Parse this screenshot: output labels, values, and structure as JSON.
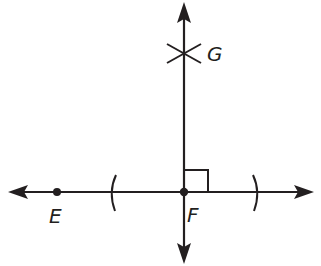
{
  "diagram": {
    "type": "geometric-construction",
    "colors": {
      "ink": "#231f20",
      "background": "#ffffff"
    },
    "points": {
      "E": {
        "label": "E",
        "x": 57,
        "y": 192
      },
      "F": {
        "label": "F",
        "x": 184,
        "y": 192
      },
      "G": {
        "label": "G",
        "x": 184,
        "y": 54
      }
    },
    "horizontal_line": {
      "x1": 8,
      "x2": 313,
      "y": 192,
      "arrows": "both"
    },
    "vertical_line": {
      "x": 184,
      "y1": 2,
      "y2": 263,
      "arrows": "both"
    },
    "arcs": [
      {
        "x": 112,
        "y": 192,
        "side": "left"
      },
      {
        "x": 256,
        "y": 192,
        "side": "right"
      }
    ],
    "right_angle_marker": {
      "x": 184,
      "y": 170,
      "size": 23
    },
    "labels": {
      "E": "E",
      "F": "F",
      "G": "G"
    }
  }
}
